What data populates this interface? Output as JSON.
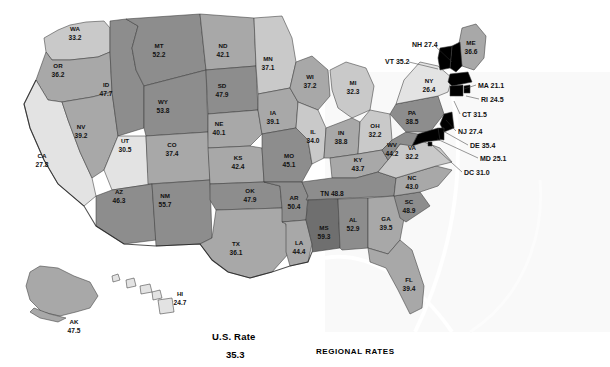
{
  "chart_data": {
    "type": "map",
    "title": "U.S. Rate",
    "subtitle": "REGIONAL RATES",
    "us_rate": "35.3",
    "unit": "rate per 100,000",
    "legend_position": "none",
    "categories": [
      "AL",
      "AK",
      "AZ",
      "AR",
      "CA",
      "CO",
      "CT",
      "DE",
      "DC",
      "FL",
      "GA",
      "HI",
      "ID",
      "IL",
      "IN",
      "IA",
      "KS",
      "KY",
      "LA",
      "ME",
      "MD",
      "MA",
      "MI",
      "MN",
      "MS",
      "MO",
      "MT",
      "NE",
      "NV",
      "NH",
      "NJ",
      "NM",
      "NY",
      "NC",
      "ND",
      "OH",
      "OK",
      "OR",
      "PA",
      "RI",
      "SC",
      "SD",
      "TN",
      "TX",
      "UT",
      "VT",
      "VA",
      "WA",
      "WV",
      "WI",
      "WY"
    ],
    "values": [
      52.9,
      47.5,
      46.3,
      50.4,
      27.8,
      37.4,
      31.5,
      35.4,
      31.0,
      39.4,
      39.5,
      24.7,
      47.7,
      34.0,
      38.8,
      39.1,
      42.4,
      43.7,
      44.4,
      36.6,
      25.1,
      21.1,
      32.3,
      37.1,
      59.3,
      45.1,
      52.2,
      40.1,
      39.2,
      27.4,
      27.4,
      55.7,
      26.4,
      43.0,
      42.1,
      32.2,
      47.9,
      36.2,
      38.5,
      24.5,
      48.9,
      47.9,
      48.8,
      36.1,
      30.5,
      35.2,
      32.2,
      33.2,
      44.2,
      37.2,
      53.8
    ],
    "value_min": 21.1,
    "value_max": 59.3,
    "shade_bins": [
      {
        "label": "lowest",
        "max": 32.0,
        "color": "#e3e3e3"
      },
      {
        "label": "low",
        "max": 38.0,
        "color": "#c9c9c9"
      },
      {
        "label": "medium",
        "max": 45.0,
        "color": "#a8a8a8"
      },
      {
        "label": "high",
        "max": 50.0,
        "color": "#8d8d8d"
      },
      {
        "label": "highest",
        "max": 60.0,
        "color": "#6f6f6f"
      }
    ]
  },
  "map": {
    "states": [
      {
        "code": "WA",
        "value": "33.2",
        "shade": "#c9c9c9",
        "lx": 75,
        "ly": 31,
        "vy": 40
      },
      {
        "code": "OR",
        "value": "36.2",
        "shade": "#a8a8a8",
        "lx": 58,
        "ly": 68,
        "vy": 77
      },
      {
        "code": "CA",
        "value": "27.8",
        "shade": "#e3e3e3",
        "lx": 42,
        "ly": 158,
        "vy": 167
      },
      {
        "code": "NV",
        "value": "39.2",
        "shade": "#a8a8a8",
        "lx": 81,
        "ly": 129,
        "vy": 138
      },
      {
        "code": "ID",
        "value": "47.7",
        "shade": "#8d8d8d",
        "lx": 106,
        "ly": 87,
        "vy": 96
      },
      {
        "code": "MT",
        "value": "52.2",
        "shade": "#8d8d8d",
        "lx": 159,
        "ly": 48,
        "vy": 57
      },
      {
        "code": "WY",
        "value": "53.8",
        "shade": "#8d8d8d",
        "lx": 163,
        "ly": 104,
        "vy": 113
      },
      {
        "code": "UT",
        "value": "30.5",
        "shade": "#e3e3e3",
        "lx": 125,
        "ly": 143,
        "vy": 152
      },
      {
        "code": "CO",
        "value": "37.4",
        "shade": "#a8a8a8",
        "lx": 172,
        "ly": 147,
        "vy": 156
      },
      {
        "code": "AZ",
        "value": "46.3",
        "shade": "#8d8d8d",
        "lx": 119,
        "ly": 194,
        "vy": 203
      },
      {
        "code": "NM",
        "value": "55.7",
        "shade": "#8d8d8d",
        "lx": 165,
        "ly": 198,
        "vy": 207
      },
      {
        "code": "ND",
        "value": "42.1",
        "shade": "#a8a8a8",
        "lx": 223,
        "ly": 48,
        "vy": 57
      },
      {
        "code": "SD",
        "value": "47.9",
        "shade": "#8d8d8d",
        "lx": 222,
        "ly": 88,
        "vy": 97
      },
      {
        "code": "NE",
        "value": "40.1",
        "shade": "#a8a8a8",
        "lx": 219,
        "ly": 126,
        "vy": 135
      },
      {
        "code": "KS",
        "value": "42.4",
        "shade": "#a8a8a8",
        "lx": 238,
        "ly": 160,
        "vy": 169
      },
      {
        "code": "OK",
        "value": "47.9",
        "shade": "#8d8d8d",
        "lx": 250,
        "ly": 193,
        "vy": 202
      },
      {
        "code": "TX",
        "value": "36.1",
        "shade": "#a8a8a8",
        "lx": 236,
        "ly": 246,
        "vy": 255
      },
      {
        "code": "MN",
        "value": "37.1",
        "shade": "#c9c9c9",
        "lx": 268,
        "ly": 61,
        "vy": 70
      },
      {
        "code": "IA",
        "value": "39.1",
        "shade": "#a8a8a8",
        "lx": 273,
        "ly": 115,
        "vy": 124
      },
      {
        "code": "MO",
        "value": "45.1",
        "shade": "#8d8d8d",
        "lx": 289,
        "ly": 158,
        "vy": 167
      },
      {
        "code": "AR",
        "value": "50.4",
        "shade": "#8d8d8d",
        "lx": 294,
        "ly": 200,
        "vy": 209
      },
      {
        "code": "LA",
        "value": "44.4",
        "shade": "#a8a8a8",
        "lx": 299,
        "ly": 245,
        "vy": 254
      },
      {
        "code": "WI",
        "value": "37.2",
        "shade": "#a8a8a8",
        "lx": 310,
        "ly": 79,
        "vy": 88
      },
      {
        "code": "IL",
        "value": "34.0",
        "shade": "#c9c9c9",
        "lx": 313,
        "ly": 134,
        "vy": 143
      },
      {
        "code": "MI",
        "value": "32.3",
        "shade": "#c9c9c9",
        "lx": 353,
        "ly": 85,
        "vy": 94
      },
      {
        "code": "IN",
        "value": "38.8",
        "shade": "#a8a8a8",
        "lx": 341,
        "ly": 135,
        "vy": 144
      },
      {
        "code": "OH",
        "value": "32.2",
        "shade": "#c9c9c9",
        "lx": 375,
        "ly": 128,
        "vy": 137
      },
      {
        "code": "KY",
        "value": "43.7",
        "shade": "#a8a8a8",
        "lx": 358,
        "ly": 162,
        "vy": 171
      },
      {
        "code": "TN",
        "value": "48.8",
        "shade": "#8d8d8d",
        "lx": 0,
        "ly": 0,
        "vy": 0
      },
      {
        "code": "MS",
        "value": "59.3",
        "shade": "#6f6f6f",
        "lx": 324,
        "ly": 230,
        "vy": 239
      },
      {
        "code": "AL",
        "value": "52.9",
        "shade": "#8d8d8d",
        "lx": 353,
        "ly": 222,
        "vy": 231
      },
      {
        "code": "GA",
        "value": "39.5",
        "shade": "#a8a8a8",
        "lx": 386,
        "ly": 221,
        "vy": 230
      },
      {
        "code": "FL",
        "value": "39.4",
        "shade": "#a8a8a8",
        "lx": 409,
        "ly": 282,
        "vy": 291
      },
      {
        "code": "SC",
        "value": "48.9",
        "shade": "#8d8d8d",
        "lx": 409,
        "ly": 204,
        "vy": 213
      },
      {
        "code": "NC",
        "value": "43.0",
        "shade": "#a8a8a8",
        "lx": 412,
        "ly": 180,
        "vy": 189
      },
      {
        "code": "VA",
        "value": "32.2",
        "shade": "#c9c9c9",
        "lx": 412,
        "ly": 150,
        "vy": 159
      },
      {
        "code": "WV",
        "value": "44.2",
        "shade": "#8d8d8d",
        "lx": 392,
        "ly": 147,
        "vy": 156
      },
      {
        "code": "PA",
        "value": "38.5",
        "shade": "#8d8d8d",
        "lx": 412,
        "ly": 115,
        "vy": 124
      },
      {
        "code": "NY",
        "value": "26.4",
        "shade": "#e3e3e3",
        "lx": 429,
        "ly": 83,
        "vy": 92
      },
      {
        "code": "ME",
        "value": "36.6",
        "shade": "#a8a8a8",
        "lx": 471,
        "ly": 45,
        "vy": 54
      },
      {
        "code": "AK",
        "value": "47.5",
        "shade": "#a8a8a8",
        "lx": 74,
        "ly": 324,
        "vy": 333
      },
      {
        "code": "HI",
        "value": "24.7",
        "shade": "#e3e3e3",
        "lx": 180,
        "ly": 296,
        "vy": 305
      }
    ],
    "tn_inline": {
      "text": "TN 48.8",
      "x": 332,
      "y": 196
    },
    "callouts": [
      {
        "code": "NH",
        "value": "27.4",
        "text": "NH 27.4",
        "tx": 412,
        "ty": 47,
        "x1": 434,
        "y1": 45,
        "x2": 452,
        "y2": 62
      },
      {
        "code": "VT",
        "value": "35.2",
        "text": "VT 35.2",
        "tx": 385,
        "ty": 64,
        "x1": 409,
        "y1": 62,
        "x2": 438,
        "y2": 69
      },
      {
        "code": "MA",
        "value": "21.1",
        "text": "MA 21.1",
        "tx": 478,
        "ty": 88,
        "x1": 476,
        "y1": 85,
        "x2": 464,
        "y2": 89
      },
      {
        "code": "RI",
        "value": "24.5",
        "text": "RI 24.5",
        "tx": 481,
        "ty": 102,
        "x1": 479,
        "y1": 99,
        "x2": 466,
        "y2": 96
      },
      {
        "code": "CT",
        "value": "31.5",
        "text": "CT 31.5",
        "tx": 462,
        "ty": 117,
        "x1": 460,
        "y1": 114,
        "x2": 454,
        "y2": 101
      },
      {
        "code": "NJ",
        "value": "27.4",
        "text": "NJ 27.4",
        "tx": 458,
        "ty": 134,
        "x1": 456,
        "y1": 131,
        "x2": 446,
        "y2": 120
      },
      {
        "code": "DE",
        "value": "35.4",
        "text": "DE 35.4",
        "tx": 470,
        "ty": 148,
        "x1": 468,
        "y1": 145,
        "x2": 443,
        "y2": 131
      },
      {
        "code": "MD",
        "value": "25.1",
        "text": "MD 25.1",
        "tx": 480,
        "ty": 161,
        "x1": 478,
        "y1": 158,
        "x2": 437,
        "y2": 139
      },
      {
        "code": "DC",
        "value": "31.0",
        "text": "DC 31.0",
        "tx": 464,
        "ty": 175,
        "x1": 462,
        "y1": 172,
        "x2": 432,
        "y2": 145
      }
    ]
  },
  "footer": {
    "us_rate_label": "U.S. Rate",
    "us_rate_value": "35.3",
    "regional_label": "REGIONAL RATES"
  }
}
